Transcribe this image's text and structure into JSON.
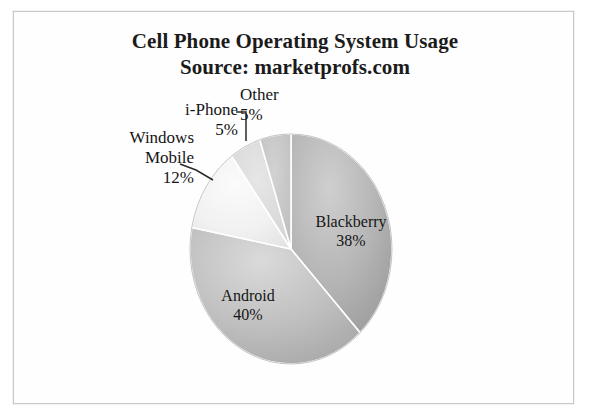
{
  "chart_data": {
    "type": "pie",
    "title": "Cell Phone Operating System Usage",
    "subtitle": "Source: marketprofs.com",
    "xlabel": "",
    "ylabel": "",
    "legend": "none",
    "grid": false,
    "start_angle_deg": 0,
    "direction": "clockwise",
    "categories": [
      "Blackberry",
      "Android",
      "Windows Mobile",
      "i-Phone",
      "Other"
    ],
    "values": [
      38,
      40,
      12,
      5,
      5
    ],
    "unit": "%",
    "labels": [
      {
        "name": "Blackberry",
        "value": 38,
        "value_text": "38%",
        "placement": "inside",
        "color": "#b0b0b0"
      },
      {
        "name": "Android",
        "value": 40,
        "value_text": "40%",
        "placement": "inside",
        "color": "#bdbdbd"
      },
      {
        "name": "Windows Mobile",
        "value": 12,
        "value_text": "12%",
        "placement": "outside-leader",
        "color": "#f2f2f2"
      },
      {
        "name": "i-Phone",
        "value": 5,
        "value_text": "5%",
        "placement": "outside-leader",
        "color": "#d9d9d9"
      },
      {
        "name": "Other",
        "value": 5,
        "value_text": "5%",
        "placement": "outside-leader",
        "color": "#c4c4c4"
      }
    ]
  },
  "header": {
    "title_line1": "Cell Phone Operating System Usage",
    "title_line2": "Source: marketprofs.com"
  },
  "callouts": {
    "windows_name": "Windows",
    "windows_name2": "Mobile",
    "windows_pct": "12%",
    "iphone_name": "i-Phone",
    "iphone_pct": "5%",
    "other_name": "Other",
    "other_pct": "5%"
  },
  "slices": {
    "blackberry_name": "Blackberry",
    "blackberry_pct": "38%",
    "android_name": "Android",
    "android_pct": "40%"
  },
  "colors": {
    "blackberry": "#b0b0b0",
    "android": "#bdbdbd",
    "windows_mobile": "#f4f4f4",
    "iphone": "#d9d9d9",
    "other": "#c6c6c6",
    "frame": "#c9c9c9",
    "text": "#151515",
    "background": "#ffffff"
  }
}
